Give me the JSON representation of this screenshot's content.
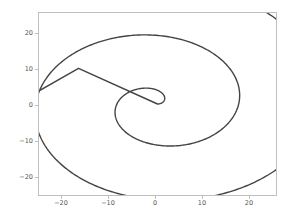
{
  "chart_data": {
    "type": "line",
    "title": "",
    "xlabel": "",
    "ylabel": "",
    "xlim": [
      -25.5,
      25.5
    ],
    "ylim": [
      -25.5,
      25.5
    ],
    "grid": false,
    "legend": null,
    "line_color": "#444444",
    "line_width": 1.4,
    "background_color": "#ffffff",
    "axes_edge_color": "#bfbfbf",
    "tick_label_color": "#555555",
    "xticks": [
      -20,
      -10,
      0,
      10,
      20
    ],
    "xtick_labels": [
      "−20",
      "−10",
      "0",
      "10",
      "20"
    ],
    "yticks": [
      -20,
      -10,
      0,
      10,
      20
    ],
    "ytick_labels": [
      "−20",
      "−10",
      "0",
      "10",
      "20"
    ],
    "series": [
      {
        "name": "spiral",
        "curve": "archimedean",
        "r_coefficient": 2.78,
        "theta_start": 0,
        "theta_end": 15.95,
        "theta_units": "radians",
        "turns": 2.54,
        "x_scale": 1.0,
        "y_scale": 0.88,
        "closing_segment": {
          "from": [
            -17.0,
            10.0
          ],
          "to": [
            0.0,
            0.0
          ]
        },
        "extents": {
          "x_min": -17.5,
          "x_max": 17.6,
          "y_min": -16.0,
          "y_max": 19.0
        },
        "sample_points": [
          [
            0.0,
            0.0
          ],
          [
            1.2,
            0.5
          ],
          [
            2.0,
            1.8
          ],
          [
            1.9,
            3.2
          ],
          [
            0.6,
            3.6
          ],
          [
            -0.8,
            2.8
          ],
          [
            -1.3,
            1.1
          ],
          [
            -0.6,
            -0.9
          ],
          [
            1.3,
            -2.1
          ],
          [
            3.6,
            -2.4
          ],
          [
            5.7,
            -1.4
          ],
          [
            6.9,
            0.9
          ],
          [
            6.8,
            3.8
          ],
          [
            5.3,
            6.5
          ],
          [
            2.7,
            8.3
          ],
          [
            -0.5,
            8.8
          ],
          [
            -3.6,
            7.9
          ],
          [
            -6.0,
            5.6
          ],
          [
            -7.3,
            2.4
          ],
          [
            -7.2,
            -1.3
          ],
          [
            -5.7,
            -4.9
          ],
          [
            -3.0,
            -7.8
          ],
          [
            0.6,
            -9.4
          ],
          [
            4.6,
            -9.5
          ],
          [
            8.3,
            -8.0
          ],
          [
            11.1,
            -5.1
          ],
          [
            12.6,
            -1.3
          ],
          [
            12.5,
            2.9
          ],
          [
            10.9,
            6.9
          ],
          [
            7.9,
            10.1
          ],
          [
            3.9,
            12.1
          ],
          [
            -0.6,
            12.6
          ],
          [
            -5.1,
            11.5
          ],
          [
            -9.0,
            8.9
          ],
          [
            -11.7,
            5.0
          ],
          [
            -13.0,
            0.4
          ],
          [
            -12.7,
            -4.4
          ],
          [
            -10.8,
            -8.9
          ],
          [
            -7.6,
            -12.4
          ],
          [
            -3.4,
            -14.7
          ],
          [
            1.3,
            -15.5
          ],
          [
            6.1,
            -14.6
          ],
          [
            10.5,
            -12.1
          ],
          [
            14.0,
            -8.3
          ],
          [
            16.3,
            -3.5
          ],
          [
            17.2,
            1.7
          ],
          [
            16.6,
            6.9
          ],
          [
            14.5,
            11.6
          ],
          [
            11.2,
            15.3
          ],
          [
            6.9,
            17.8
          ],
          [
            2.0,
            18.9
          ],
          [
            -3.1,
            18.5
          ],
          [
            -8.0,
            16.6
          ],
          [
            -12.3,
            13.4
          ],
          [
            -15.6,
            9.1
          ],
          [
            -17.0,
            10.0
          ],
          [
            0.0,
            0.0
          ]
        ]
      }
    ]
  }
}
